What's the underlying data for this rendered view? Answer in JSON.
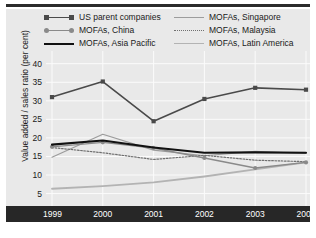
{
  "chart_data": {
    "type": "line",
    "title": "",
    "xlabel": "",
    "ylabel": "Value added / sales ratio (per cent)",
    "x": [
      1999,
      2000,
      2001,
      2002,
      2003,
      2004
    ],
    "xticklabels": [
      "1999",
      "2000",
      "2001",
      "2002",
      "2003",
      "2004"
    ],
    "yticklabels": [
      "40",
      "35",
      "30",
      "25",
      "20",
      "15",
      "10",
      "5"
    ],
    "yticks": [
      40,
      35,
      30,
      25,
      20,
      15,
      10,
      5
    ],
    "ylim": [
      3,
      41
    ],
    "grid": true,
    "legend_position": "top",
    "series": [
      {
        "name": "US parent companies",
        "values": [
          31.0,
          35.2,
          24.5,
          30.5,
          33.5,
          33.0
        ],
        "color": "#4a4a4a",
        "style": "solid",
        "marker": "square",
        "width": 1.6
      },
      {
        "name": "MOFAs, China",
        "values": [
          17.6,
          18.8,
          17.3,
          14.6,
          11.9,
          13.4
        ],
        "color": "#8a8a8a",
        "style": "solid",
        "marker": "circle",
        "width": 1.4
      },
      {
        "name": "MOFAs, Asia Pacific",
        "values": [
          18.2,
          19.3,
          17.4,
          16.0,
          16.1,
          16.0
        ],
        "color": "#111111",
        "style": "solid",
        "marker": "none",
        "width": 2.1
      },
      {
        "name": "MOFAs, Singapore",
        "values": [
          14.8,
          21.0,
          16.7,
          15.2,
          16.4,
          15.8
        ],
        "color": "#9c9c9c",
        "style": "solid",
        "marker": "none",
        "width": 1.2
      },
      {
        "name": "MOFAs, Malaysia",
        "values": [
          17.4,
          16.0,
          14.2,
          15.3,
          14.0,
          13.6
        ],
        "color": "#707070",
        "style": "dotted",
        "marker": "none",
        "width": 1.2
      },
      {
        "name": "MOFAs, Latin America",
        "values": [
          6.3,
          7.0,
          8.0,
          9.6,
          11.5,
          13.4
        ],
        "color": "#b3b3b3",
        "style": "solid",
        "marker": "none",
        "width": 1.8
      }
    ]
  },
  "legend": {
    "columns": [
      [
        {
          "label": "US parent companies",
          "key": "us-parent-companies"
        },
        {
          "label": "MOFAs, China",
          "key": "mofas-china"
        },
        {
          "label": "MOFAs, Asia Pacific",
          "key": "mofas-asia-pacific"
        }
      ],
      [
        {
          "label": "MOFAs, Singapore",
          "key": "mofas-singapore"
        },
        {
          "label": "MOFAs, Malaysia",
          "key": "mofas-malaysia"
        },
        {
          "label": "MOFAs, Latin America",
          "key": "mofas-latin-america"
        }
      ]
    ]
  },
  "caption": {
    "text": ""
  }
}
